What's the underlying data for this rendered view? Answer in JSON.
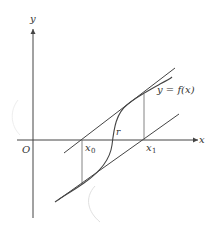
{
  "diagram": {
    "colors": {
      "line": "#444444",
      "text": "#333333",
      "background": "#ffffff",
      "faint": "#d8d8d8"
    },
    "labels": {
      "y_axis": "y",
      "x_axis": "x",
      "origin": "O",
      "x0": "x",
      "x0_sub": "0",
      "x1": "x",
      "x1_sub": "1",
      "root": "r",
      "curve": "y = f(x)"
    }
  }
}
